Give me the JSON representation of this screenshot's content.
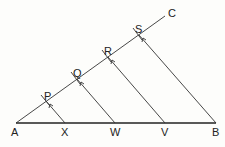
{
  "diagram": {
    "points": {
      "A": {
        "label": "A",
        "x": 16,
        "y": 123
      },
      "X": {
        "label": "X",
        "x": 65,
        "y": 123
      },
      "W": {
        "label": "W",
        "x": 115,
        "y": 123
      },
      "V": {
        "label": "V",
        "x": 165,
        "y": 123
      },
      "B": {
        "label": "B",
        "x": 216,
        "y": 123
      },
      "P": {
        "label": "P",
        "x": 46,
        "y": 101
      },
      "Q": {
        "label": "Q",
        "x": 77,
        "y": 79
      },
      "R": {
        "label": "R",
        "x": 108,
        "y": 57
      },
      "S": {
        "label": "S",
        "x": 139,
        "y": 35
      },
      "C": {
        "label": "C",
        "x": 165,
        "y": 16
      }
    },
    "segments": [
      {
        "name": "AB",
        "from": "A",
        "to": "B"
      },
      {
        "name": "AC",
        "from": "A",
        "to": "C"
      },
      {
        "name": "PX",
        "from": "P",
        "to": "X"
      },
      {
        "name": "QW",
        "from": "Q",
        "to": "W"
      },
      {
        "name": "RV",
        "from": "R",
        "to": "V"
      },
      {
        "name": "SB",
        "from": "S",
        "to": "B"
      }
    ]
  }
}
